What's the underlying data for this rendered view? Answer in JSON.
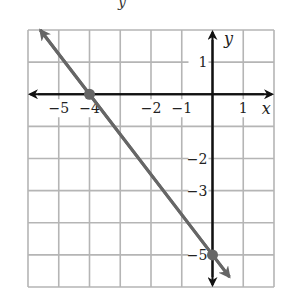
{
  "header": {
    "fragment": "y"
  },
  "chart_data": {
    "type": "line",
    "title": "",
    "xlabel": "x",
    "ylabel": "y",
    "xlim": [
      -6,
      2
    ],
    "ylim": [
      -6,
      2
    ],
    "grid": true,
    "x_tick_labels": [
      "−5",
      "−4",
      "−2",
      "−1",
      "1"
    ],
    "x_tick_values": [
      -5,
      -4,
      -2,
      -1,
      1
    ],
    "y_tick_labels": [
      "1",
      "−2",
      "−3",
      "−5"
    ],
    "y_tick_values": [
      1,
      -2,
      -3,
      -5
    ],
    "series": [
      {
        "name": "line",
        "equation": "y = -5/4 x - 5",
        "slope": -1.25,
        "intercept": -5,
        "x": [
          -5.6,
          0.55
        ],
        "y": [
          2.0,
          -5.69
        ],
        "marked_points": [
          {
            "x": -4,
            "y": 0
          },
          {
            "x": 0,
            "y": -5
          }
        ],
        "color": "#666666"
      }
    ],
    "colors": {
      "grid": "#b5b5b5",
      "axes": "#111111",
      "line": "#666666"
    }
  }
}
